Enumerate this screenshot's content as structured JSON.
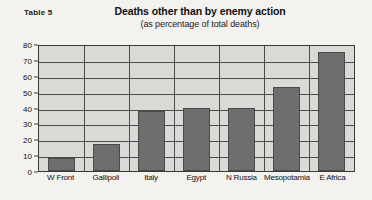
{
  "table_label": "Table 5",
  "chart_data": {
    "type": "bar",
    "title": "Deaths other than by enemy action",
    "subtitle": "(as percentage of total deaths)",
    "xlabel": "",
    "ylabel": "",
    "ylim": [
      0,
      80
    ],
    "ytick_step": 10,
    "yticks": [
      "80",
      "70",
      "60",
      "50",
      "40",
      "30",
      "20",
      "10",
      "0"
    ],
    "grid": true,
    "legend": false,
    "bar_color": "#6e6e6e",
    "plot_background": "#d9d9d6",
    "axis_color": "#3a3a3a",
    "categories": [
      "W Front",
      "Gallipoli",
      "Italy",
      "Egypt",
      "N Russia",
      "Mesopotamia",
      "E Africa"
    ],
    "values": [
      8,
      17,
      38,
      40,
      40,
      53,
      75
    ]
  }
}
